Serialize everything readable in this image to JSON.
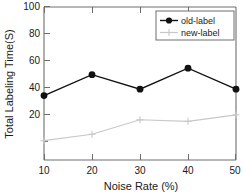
{
  "chart_data": {
    "type": "line",
    "title": "",
    "xlabel": "Noise Rate (%)",
    "ylabel": "Total Labeling Time(S)",
    "x": [
      10,
      20,
      30,
      40,
      50
    ],
    "xticklabels": [
      "10",
      "20",
      "30",
      "40",
      "50"
    ],
    "yticklabels": [
      "20",
      "40",
      "60",
      "80",
      "100"
    ],
    "yticks": [
      20,
      40,
      60,
      80,
      100
    ],
    "xlim": [
      10,
      50
    ],
    "ylim": [
      5,
      100
    ],
    "grid": false,
    "legend_position": "top-right",
    "series": [
      {
        "name": "old-label",
        "values": [
          45,
          58,
          49,
          62,
          49
        ],
        "color": "#111111",
        "marker": "filled-circle"
      },
      {
        "name": "new-label",
        "values": [
          17,
          21,
          30,
          29,
          33
        ],
        "color": "#c8c8c8",
        "marker": "plus"
      }
    ]
  },
  "legend": {
    "entries": [
      {
        "label": "old-label"
      },
      {
        "label": "new-label"
      }
    ]
  },
  "axes": {
    "x_title": "Noise Rate (%)",
    "y_title": "Total Labeling Time(S)"
  },
  "colors": {
    "old_label": "#111111",
    "new_label": "#c8c8c8",
    "axis": "#6e6e6e",
    "text": "#1a1a1a"
  }
}
